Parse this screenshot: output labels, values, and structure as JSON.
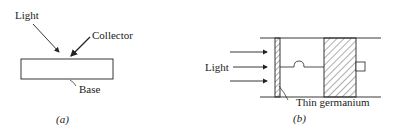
{
  "figure": {
    "panel_a": {
      "caption": "(a)",
      "labels": {
        "light": "Light",
        "collector": "Collector",
        "base": "Base"
      }
    },
    "panel_b": {
      "caption": "(b)",
      "labels": {
        "light": "Light",
        "thin_germanium": "Thin germanium"
      }
    }
  }
}
